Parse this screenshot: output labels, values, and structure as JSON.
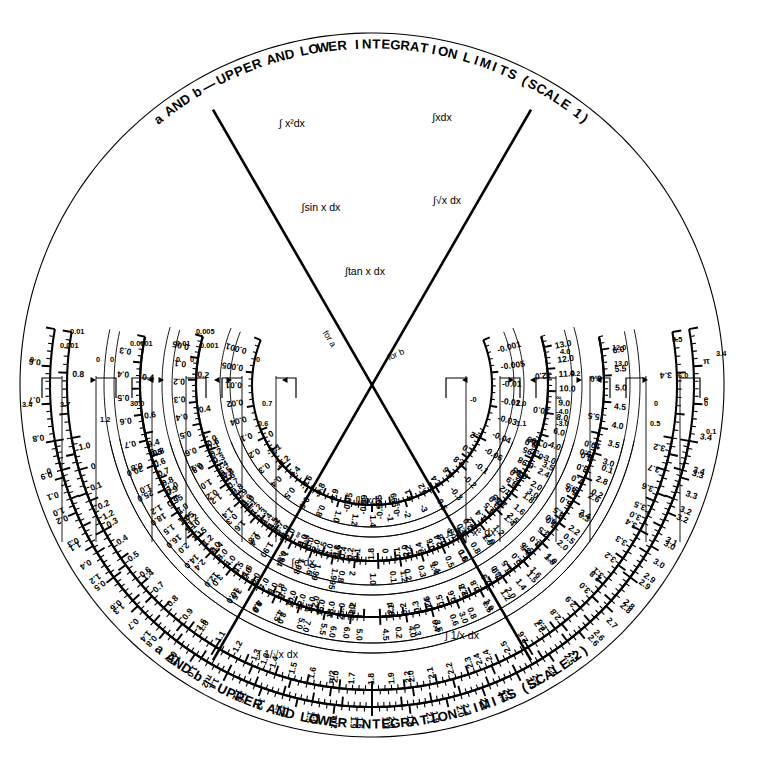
{
  "figure": {
    "kind": "circular-integration-nomograph",
    "center": {
      "x": 372,
      "y": 385
    },
    "title_top": "a AND b — UPPER AND LOWER INTEGRATION LIMITS (SCALE 1)",
    "title_bottom": "a AND b — UPPER AND LOWER INTEGRATION LIMITS (SCALE 2)",
    "center_labels": {
      "for_a": "for a",
      "for_b": "for b"
    }
  },
  "chart_data": {
    "type": "nomograph",
    "grid": false,
    "legend": null,
    "rings_upper": [
      {
        "id": "scale1-outer",
        "label": "a AND b — UPPER AND LOWER INTEGRATION LIMITS (SCALE 1)",
        "radius": 305,
        "inner_ticks": [
          "0.8",
          "1.0",
          "1.2",
          "1.4",
          "1.6",
          "1.8",
          "2.0",
          "2.2",
          "2.4",
          "2.6",
          "2.8",
          "3.0",
          "3.2",
          "3.4"
        ],
        "outer_ticks": [
          "0.6",
          "0.7",
          "0.8",
          "0.9",
          "1.0",
          "1.1",
          "1.2",
          "1.3",
          "1.4",
          "1.5",
          "π/2",
          "1.6",
          "1.7",
          "1.8",
          "1.9",
          "2.0",
          "2.1",
          "2.2",
          "2.3",
          "2.4",
          "2.5",
          "2.6",
          "2.8",
          "2.9",
          "3.0",
          "3.2",
          "3.3",
          "3.4",
          "e",
          "π"
        ]
      },
      {
        "id": "int-x2-dx",
        "label": "∫ x²dx",
        "radius": 246,
        "ticks": [
          "0.3",
          "0.4",
          "0.5",
          "0.6",
          "0.7",
          "0.8",
          "1.0",
          "1.2",
          "1.5",
          "2.0",
          "2.4",
          "3.0",
          "3.5",
          "4.0",
          "4.5",
          "5.0",
          "5.5",
          "6.0"
        ]
      },
      {
        "id": "int-x-dx",
        "label": "∫xdx",
        "radius": 246,
        "ticks": [
          "0.2",
          "0.3",
          "0.4",
          "0.6",
          "0.8",
          "1.0",
          "1.2",
          "1.4",
          "1.6",
          "1.8",
          "2.0",
          "2.2",
          "2.4",
          "2.6",
          "2.8",
          "3.0",
          "3.5",
          "4.0",
          "4.5",
          "5.0",
          "5.5",
          "6.0"
        ]
      },
      {
        "id": "int-sqrt-x-dx",
        "label": "∫√x dx",
        "radius": 188,
        "ticks": [
          "0.1",
          "0.2",
          "0.3",
          "0.4",
          "0.5",
          "0.6",
          "0.8",
          "1.0",
          "1.2",
          "1.4",
          "1.6",
          "1.8",
          "2.0",
          "2.4",
          "3.0",
          "4.0",
          "6.0",
          "8.0",
          "9.0",
          "10.0",
          "11.0",
          "12.0",
          "13.0"
        ]
      },
      {
        "id": "int-sin-x-dx",
        "label": "∫sin x dx",
        "radius": 188,
        "ticks": [
          "0.05",
          "0.1",
          "0.2",
          "0.3",
          "0.4",
          "0.5",
          "0.6",
          "0.8",
          "1.0",
          "1.2",
          "1.4",
          "1.6",
          "1.8",
          "1.90",
          "1.94",
          "1.98",
          "1.99",
          "1.995",
          "2"
        ]
      },
      {
        "id": "int-tan-x-dx",
        "label": "∫tan x dx",
        "radius": 130,
        "ticks": [
          "0.001",
          "0.005",
          "0.01",
          "0.02",
          "0.04",
          "0.1",
          "0.2",
          "0.3",
          "0.4",
          "0.5",
          "0.6",
          "0.8",
          "1.0",
          "1.2",
          "1.4",
          "-1",
          "-2",
          "-3",
          "-0.5",
          "-0.3",
          "-0.2",
          "-0.1",
          "-0.06",
          "-0.04",
          "-0.03",
          "-0.02",
          "-0.01",
          "-0.005",
          "-0.001"
        ]
      }
    ],
    "rings_lower": [
      {
        "id": "scale2-outer",
        "label": "a AND b — UPPER AND LOWER INTEGRATION LIMITS (SCALE 2)",
        "radius": 305,
        "ticks": [
          "0",
          "0.1",
          "0.2",
          "0.3",
          "0.4",
          "0.5",
          "0.6",
          "0.7",
          "0.8",
          "0.9",
          "1.0",
          "1.1",
          "1.2",
          "1.3",
          "1.4",
          "1.5",
          "1.6",
          "π/2",
          "1.7",
          "1.8",
          "1.9",
          "2.0",
          "2.1",
          "2.2",
          "2.3",
          "2.4",
          "2.5",
          "2.6",
          "2.7",
          "2.8",
          "2.9",
          "3.0",
          "3.1",
          "3.2",
          "3.3",
          "3.4",
          "3.5",
          "3.6",
          "3.7"
        ]
      },
      {
        "id": "int-inv-sqrt-x-dx",
        "label": "∫ (1/√x) dx",
        "radius": 246,
        "ticks": [
          "0.4",
          "0.5",
          "0.6",
          "0.7",
          "0.8",
          "0.9",
          "0.95",
          "1.0",
          "1.05",
          "1.10",
          "1.15",
          "1.2",
          "2.0",
          "3.0",
          "4.0",
          "4.5",
          "5.0",
          "6.0",
          "7.0",
          "8.0",
          "9.0",
          "10.0",
          "12.0",
          "14.0",
          "16.0",
          "18.0",
          "25.0",
          "30.0"
        ]
      },
      {
        "id": "int-ex-dx",
        "label": "∫eˣdx",
        "radius": 246,
        "ticks": [
          "0.1",
          "0.2",
          "0.3",
          "0.4",
          "0.5",
          "0.6",
          "0.7",
          "0.8",
          "0.9",
          "1.0",
          "1.5",
          "2.0",
          "2.5",
          "3.0",
          "3.5",
          "4.0",
          "4.5",
          "5.0",
          "6.0",
          "7.0",
          "8.0",
          "9.0",
          "10.0"
        ]
      },
      {
        "id": "int-inv-x-dx",
        "label": "∫ (1/x) dx",
        "radius": 188,
        "ticks": [
          "0",
          "0.1",
          "0.2",
          "0.3",
          "0.4",
          "0.5",
          "0.6",
          "0.7",
          "0.8",
          "0.9",
          "1.0",
          "1.1",
          "1.2",
          "1.3",
          "1.4",
          "1.5",
          "1.7",
          "1.9",
          "2.0",
          "∞",
          "-4.0",
          "-3.0",
          "-2.0",
          "-1.5",
          "-1.0",
          "-0.6",
          "-0.4",
          "-0.2",
          "-0.1"
        ]
      },
      {
        "id": "int-sqrt-2x-x2-dx",
        "label": "∫√(2x−x²) dx",
        "radius": 188,
        "ticks": [
          "0",
          "0.1",
          "0.2",
          "0.4",
          "0.6",
          "0.8",
          "π/4",
          "1.0",
          "1.2",
          "1.4",
          "1.5",
          "1.55",
          "π/2",
          "-0.9",
          "-0.95",
          "-0.98",
          "-0.995",
          "-0.999"
        ]
      },
      {
        "id": "int-ln-x-dx",
        "label": "∫lnxdx",
        "radius": 130,
        "ticks": [
          "0",
          "-0.1",
          "-0.2",
          "-0.4",
          "-0.6",
          "-0.8",
          "-0.9",
          "-0.95",
          "-0.99",
          "-0.995",
          "-0.999",
          "0.1",
          "0.2",
          "0.4",
          "0.6",
          "0.8",
          "1.0",
          "1.2"
        ]
      }
    ],
    "radial_axes": [
      {
        "name": "for a",
        "angle_deg": 240
      },
      {
        "name": "for b",
        "angle_deg": 300
      }
    ]
  },
  "labels": {
    "integrals_upper": [
      {
        "text": "∫ x²dx",
        "x": 292,
        "y": 124
      },
      {
        "text": "∫xdx",
        "x": 442,
        "y": 118
      },
      {
        "text": "∫sin x dx",
        "x": 321,
        "y": 208
      },
      {
        "text": "∫√x dx",
        "x": 447,
        "y": 201
      },
      {
        "text": "∫tan x dx",
        "x": 365,
        "y": 272
      }
    ],
    "integrals_lower": [
      {
        "text": "∫lnxdx",
        "x": 369,
        "y": 501
      },
      {
        "text": "∫√2x−x² dx",
        "x": 471,
        "y": 533
      },
      {
        "text": "∫eˣdx",
        "x": 303,
        "y": 563
      },
      {
        "text": "∫ 1/x dx",
        "x": 462,
        "y": 636
      },
      {
        "text": "∫ 1/√x dx",
        "x": 278,
        "y": 655
      }
    ]
  },
  "scale_values": {
    "scale1_outer_major": [
      "0.6",
      "0.7",
      "0.8",
      "0.9",
      "1.0",
      "1.1",
      "1.2",
      "1.3",
      "1.4",
      "1.5",
      "π/2",
      "1.6",
      "1.7",
      "1.8",
      "1.9",
      "2.0",
      "2.1",
      "2.2",
      "2.3",
      "2.4",
      "2.5",
      "2.6"
    ],
    "scale1_inner_major": [
      "0.8",
      "1.0",
      "1.2",
      "1.4",
      "1.6",
      "1.8",
      "2.0",
      "2.2",
      "2.4",
      "2.6",
      "2.8",
      "3.0",
      "3.2",
      "3.4"
    ],
    "right_column_e_pi": [
      "e",
      "2.8",
      "2.9",
      "3.0",
      "π",
      "3.2",
      "3.3",
      "3.4"
    ],
    "right_inner": [
      "3.5",
      "4.0",
      "4.5",
      "5.0",
      "5.5",
      "6.0"
    ],
    "right_mid": [
      "6.0",
      "7.0",
      "8.0",
      "9.0",
      "10.0",
      "11.0",
      "12.0",
      "13.0"
    ],
    "right_mid2": [
      "3.0",
      "3.2",
      "3.4",
      "3.6",
      "3.8",
      "4.0",
      "4.2"
    ],
    "right_low": [
      "1.0",
      "1.1",
      "1.2",
      "1.3",
      "1.4",
      "1.5",
      "1.7",
      "1.9",
      "2.0"
    ],
    "right_low_neg": [
      "∞",
      "-4.0",
      "-3.0",
      "-2.0",
      "-1.5",
      "-1.0",
      "-0.6",
      "-0.4",
      "-0.2",
      "-0.1",
      "0"
    ],
    "right_bottom": [
      "0",
      "0.5",
      "0.8",
      "1.0",
      "1.2",
      "1.5",
      "1.7",
      "1.9"
    ],
    "right_bottom2": [
      "0",
      "0.1",
      "0.2",
      "0.3",
      "0.4",
      "0.5",
      "0.6",
      "0.7",
      "0.8",
      "0.9"
    ],
    "left_outer": [
      "0",
      "0.1",
      "0.2",
      "0.3",
      "0.4",
      "0.5",
      "0.6",
      "0.7",
      "0.8",
      "0.9",
      "1.0"
    ],
    "left_outer2": [
      "0",
      "0.001",
      "0.005",
      "0.01",
      "0.02",
      "0.05",
      "0.1",
      "0.2",
      "0.3",
      "0.4"
    ],
    "left_mid": [
      "0",
      "0.0001",
      "0.001",
      "0.005",
      "0.01",
      "0.02",
      "0.05",
      "0.1",
      "0.2",
      "0.3",
      "0.4",
      "0.5"
    ],
    "left_inner": [
      "0",
      "0.001",
      "0.01",
      "0.02",
      "0.04",
      "0.06",
      "0.1",
      "0.2",
      "0.3",
      "0.5"
    ],
    "left_bottom": [
      "0",
      "3.3",
      "3.4",
      "3.5",
      "3.6",
      "3.7"
    ],
    "left_bottom2": [
      "1.0",
      "1.05",
      "1.10",
      "1.15",
      "1.2",
      "14.0",
      "16.0",
      "18.0",
      "25.0",
      "30.0"
    ],
    "left_bottom3": [
      "0",
      "0.1",
      "0.2",
      "0.4",
      "0.6",
      "0.7",
      "0.8",
      "0.9"
    ],
    "bottom_center": [
      "0.5",
      "0.6",
      "0.7",
      "0.8",
      "4.5",
      "5.0",
      "6.0",
      "7.0",
      "8.0",
      "9.0",
      "10.0"
    ]
  }
}
